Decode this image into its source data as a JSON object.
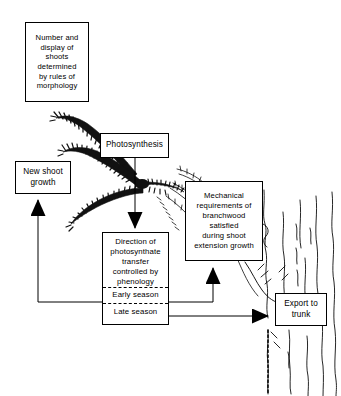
{
  "diagram": {
    "boxes": {
      "morphology": {
        "name": "morphology-box",
        "lines": [
          "Number and",
          "display of",
          "shoots",
          "determined",
          "by rules of",
          "morphology"
        ]
      },
      "photosynthesis": {
        "name": "photosynthesis-box",
        "lines": [
          "Photosynthesis"
        ]
      },
      "new_shoot_growth": {
        "name": "new-shoot-growth-box",
        "lines": [
          "New shoot",
          "growth"
        ]
      },
      "mechanical": {
        "name": "mechanical-requirements-box",
        "lines": [
          "Mechanical",
          "requirements of",
          "branchwood",
          "satisfied",
          "during shoot",
          "extension growth"
        ]
      },
      "direction": {
        "name": "direction-of-photosynthate-box",
        "lines": [
          "Direction of",
          "photosynthate",
          "transfer",
          "controlled by",
          "phenology"
        ],
        "early_season": "Early season",
        "late_season": "Late season"
      },
      "export": {
        "name": "export-to-trunk-box",
        "lines": [
          "Export to",
          "trunk"
        ]
      }
    },
    "illustration": {
      "palm_crown": "palm-fronds-illustration",
      "trunk": "tree-trunk-illustration"
    },
    "colors": {
      "ink": "#000000",
      "paper": "#ffffff"
    }
  }
}
